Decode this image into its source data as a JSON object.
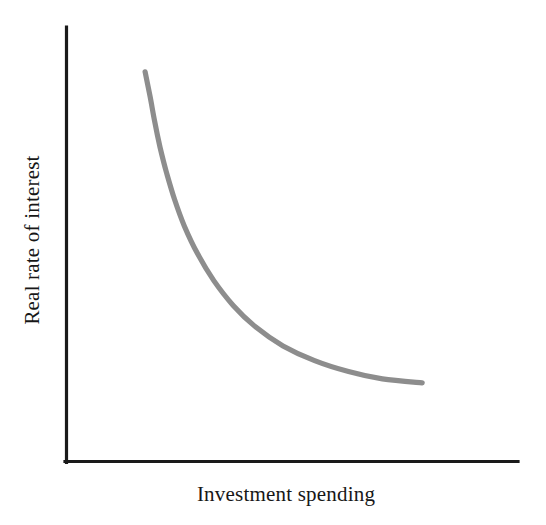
{
  "figure": {
    "background_color": "#ffffff",
    "axis_color": "#1a1a1a",
    "curve_color": "#8d8d8d"
  },
  "labels": {
    "xlabel": "Investment spending",
    "ylabel": "Real rate of interest"
  },
  "chart_data": {
    "type": "line",
    "title": "",
    "subtitle": "",
    "xlabel": "Investment spending",
    "ylabel": "Real rate of interest",
    "xlim": [
      0,
      100
    ],
    "ylim": [
      0,
      100
    ],
    "grid": false,
    "legend": null,
    "axis_ticks": {
      "x": [],
      "y": []
    },
    "annotations": [],
    "series": [
      {
        "name": "Investment demand curve",
        "color": "#8d8d8d",
        "linewidth": 5,
        "points": [
          {
            "x": 17.5,
            "y": 89.7
          },
          {
            "x": 18.6,
            "y": 84.0
          },
          {
            "x": 19.6,
            "y": 78.4
          },
          {
            "x": 20.8,
            "y": 72.4
          },
          {
            "x": 22.2,
            "y": 66.7
          },
          {
            "x": 24.0,
            "y": 60.4
          },
          {
            "x": 26.2,
            "y": 54.2
          },
          {
            "x": 29.1,
            "y": 47.9
          },
          {
            "x": 32.7,
            "y": 41.7
          },
          {
            "x": 37.0,
            "y": 36.0
          },
          {
            "x": 42.0,
            "y": 31.0
          },
          {
            "x": 48.0,
            "y": 26.7
          },
          {
            "x": 55.0,
            "y": 23.3
          },
          {
            "x": 62.5,
            "y": 20.8
          },
          {
            "x": 70.0,
            "y": 19.1
          },
          {
            "x": 78.8,
            "y": 18.2
          }
        ]
      }
    ]
  },
  "geometry": {
    "y_axis": {
      "x": 66,
      "y_top": 27,
      "y_bottom": 463
    },
    "x_axis": {
      "y": 462,
      "x_left": 65,
      "x_right": 518
    },
    "curve_path": "M 145,72 C 152,105 159,146 165,186 C 172,228 182,265 196,296 C 211,328 232,351 258,366 C 288,383 328,388 372,389 L 422,389"
  }
}
